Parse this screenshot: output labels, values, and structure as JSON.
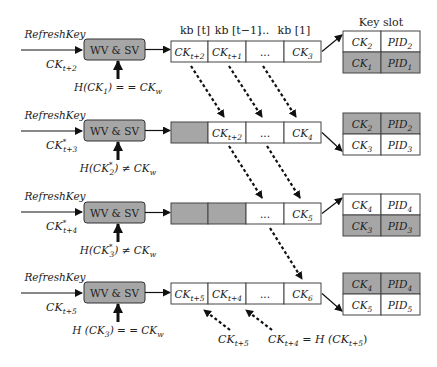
{
  "header": {
    "kb_labels": [
      "kb [t]",
      "kb [t−1]",
      "...",
      "kb [1]"
    ],
    "key_slot_title": "Key slot"
  },
  "wv_label": "WV & SV",
  "rows": [
    {
      "input_label": "RefreshKey",
      "key_label": "CK",
      "key_sub": "t+2",
      "key_star": "",
      "hash_check": "H(CK",
      "hash_sub": "1",
      "hash_star": "",
      "hash_op": ") = = CK",
      "hash_w": "w",
      "kb_cells": [
        {
          "text": "CK",
          "sub": "t+2",
          "shade": "white"
        },
        {
          "text": "CK",
          "sub": "t+1",
          "shade": "white"
        },
        {
          "text": "...",
          "sub": "",
          "shade": "white"
        },
        {
          "text": "CK",
          "sub": "3",
          "shade": "white"
        }
      ],
      "key_slot": [
        {
          "ck": "CK",
          "ck_sub": "2",
          "pid": "PID",
          "pid_sub": "2",
          "shade": "white"
        },
        {
          "ck": "CK",
          "ck_sub": "1",
          "pid": "PID",
          "pid_sub": "1",
          "shade": "gray"
        }
      ]
    },
    {
      "input_label": "RefreshKey",
      "key_label": "CK",
      "key_sub": "t+3",
      "key_star": "*",
      "hash_check": "H(CK",
      "hash_sub": "2",
      "hash_star": "*",
      "hash_op": ") ≠ CK",
      "hash_w": "w",
      "kb_cells": [
        {
          "text": "",
          "sub": "",
          "shade": "gray"
        },
        {
          "text": "CK",
          "sub": "t+2",
          "shade": "white"
        },
        {
          "text": "...",
          "sub": "",
          "shade": "white"
        },
        {
          "text": "CK",
          "sub": "4",
          "shade": "white"
        }
      ],
      "key_slot": [
        {
          "ck": "CK",
          "ck_sub": "2",
          "pid": "PID",
          "pid_sub": "2",
          "shade": "gray"
        },
        {
          "ck": "CK",
          "ck_sub": "3",
          "pid": "PID",
          "pid_sub": "3",
          "shade": "white"
        }
      ]
    },
    {
      "input_label": "RefreshKey",
      "key_label": "CK",
      "key_sub": "t+4",
      "key_star": "*",
      "hash_check": "H(CK",
      "hash_sub": "3",
      "hash_star": "*",
      "hash_op": ") ≠ CK",
      "hash_w": "w",
      "kb_cells": [
        {
          "text": "",
          "sub": "",
          "shade": "gray"
        },
        {
          "text": "",
          "sub": "",
          "shade": "gray"
        },
        {
          "text": "...",
          "sub": "",
          "shade": "white"
        },
        {
          "text": "CK",
          "sub": "5",
          "shade": "white"
        }
      ],
      "key_slot": [
        {
          "ck": "CK",
          "ck_sub": "4",
          "pid": "PID",
          "pid_sub": "4",
          "shade": "white"
        },
        {
          "ck": "CK",
          "ck_sub": "3",
          "pid": "PID",
          "pid_sub": "3",
          "shade": "gray"
        }
      ]
    },
    {
      "input_label": "RefreshKey",
      "key_label": "CK",
      "key_sub": "t+5",
      "key_star": "",
      "hash_check": "H (CK",
      "hash_sub": "3",
      "hash_star": "",
      "hash_op": ") = = CK",
      "hash_w": "w",
      "kb_cells": [
        {
          "text": "CK",
          "sub": "t+5",
          "shade": "white"
        },
        {
          "text": "CK",
          "sub": "t+4",
          "shade": "white"
        },
        {
          "text": "...",
          "sub": "",
          "shade": "white"
        },
        {
          "text": "CK",
          "sub": "6",
          "shade": "white"
        }
      ],
      "key_slot": [
        {
          "ck": "CK",
          "ck_sub": "4",
          "pid": "PID",
          "pid_sub": "4",
          "shade": "gray"
        },
        {
          "ck": "CK",
          "ck_sub": "5",
          "pid": "PID",
          "pid_sub": "5",
          "shade": "white"
        }
      ]
    }
  ],
  "bottom_labels": {
    "left": {
      "text": "CK",
      "sub": "t+5"
    },
    "right": {
      "text": "CK",
      "sub": "t+4",
      "mid": " = H (CK",
      "sub2": "t+5",
      "end": ")"
    }
  },
  "colors": {
    "gray_fill": "#a6a6a6",
    "stroke": "#333333"
  }
}
